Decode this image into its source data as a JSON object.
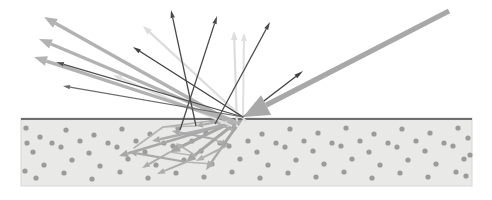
{
  "figure": {
    "width": 492,
    "height": 200,
    "background_color": "#ffffff"
  },
  "colors": {
    "background": "#ffffff",
    "substrate_fill": "#e9e9e7",
    "substrate_fill_right": "#ebebe9",
    "substrate_edge": "#d8d8d6",
    "surface_line": "#6f6f6f",
    "atom_dot": "#9b9b9b",
    "incident_beam": "#a8a8a8",
    "ejected_arrow_bold": "#b2b2b2",
    "ejected_arrow_thin_dark": "#555555",
    "ejected_arrow_faint": "#dcdcdc",
    "cascade_arrow": "#a6a6a6"
  },
  "substrate": {
    "label": "solid target material",
    "x": 21,
    "y": 118,
    "width": 451,
    "height": 68,
    "surface_line_y": 119,
    "surface_line_thickness": 2.2
  },
  "atoms": {
    "label": "target atoms",
    "radius": 2.6,
    "positions": [
      [
        40,
        137
      ],
      [
        66,
        130
      ],
      [
        94,
        135
      ],
      [
        122,
        129
      ],
      [
        150,
        134
      ],
      [
        178,
        128
      ],
      [
        206,
        133
      ],
      [
        234,
        128
      ],
      [
        262,
        134
      ],
      [
        290,
        129
      ],
      [
        318,
        133
      ],
      [
        346,
        128
      ],
      [
        374,
        134
      ],
      [
        402,
        129
      ],
      [
        430,
        133
      ],
      [
        458,
        128
      ],
      [
        33,
        152
      ],
      [
        61,
        147
      ],
      [
        89,
        153
      ],
      [
        117,
        147
      ],
      [
        145,
        152
      ],
      [
        173,
        146
      ],
      [
        201,
        151
      ],
      [
        229,
        146
      ],
      [
        257,
        152
      ],
      [
        285,
        147
      ],
      [
        313,
        151
      ],
      [
        341,
        146
      ],
      [
        369,
        152
      ],
      [
        397,
        147
      ],
      [
        425,
        151
      ],
      [
        453,
        146
      ],
      [
        470,
        155
      ],
      [
        44,
        165
      ],
      [
        72,
        160
      ],
      [
        100,
        166
      ],
      [
        128,
        159
      ],
      [
        156,
        165
      ],
      [
        184,
        160
      ],
      [
        212,
        164
      ],
      [
        240,
        159
      ],
      [
        268,
        165
      ],
      [
        296,
        160
      ],
      [
        324,
        164
      ],
      [
        352,
        159
      ],
      [
        380,
        165
      ],
      [
        408,
        160
      ],
      [
        436,
        164
      ],
      [
        464,
        159
      ],
      [
        36,
        178
      ],
      [
        64,
        173
      ],
      [
        92,
        179
      ],
      [
        120,
        172
      ],
      [
        148,
        178
      ],
      [
        176,
        173
      ],
      [
        204,
        177
      ],
      [
        232,
        172
      ],
      [
        260,
        178
      ],
      [
        288,
        173
      ],
      [
        316,
        177
      ],
      [
        344,
        172
      ],
      [
        372,
        178
      ],
      [
        400,
        173
      ],
      [
        428,
        177
      ],
      [
        456,
        172
      ],
      [
        26,
        128
      ],
      [
        27,
        143
      ],
      [
        25,
        171
      ],
      [
        468,
        138
      ],
      [
        466,
        176
      ],
      [
        108,
        143
      ],
      [
        136,
        141
      ],
      [
        164,
        143
      ],
      [
        192,
        141
      ],
      [
        220,
        143
      ],
      [
        248,
        141
      ],
      [
        276,
        143
      ],
      [
        304,
        141
      ],
      [
        332,
        143
      ],
      [
        360,
        141
      ],
      [
        388,
        143
      ],
      [
        416,
        141
      ],
      [
        444,
        143
      ],
      [
        52,
        143
      ],
      [
        80,
        141
      ]
    ]
  },
  "incident_beam": {
    "label": "incident ion beam",
    "start": [
      449,
      11
    ],
    "end": [
      243,
      117
    ],
    "line_width": 5.2,
    "arrowhead_length": 26,
    "arrowhead_half_width": 11,
    "color": "#a8a8a8"
  },
  "impact_point": {
    "label": "impact point",
    "x": 243,
    "y": 117
  },
  "sputtered_arrows": {
    "label": "sputtered / backscattered particles",
    "bold": [
      {
        "name": "sputter-bold-1",
        "from": [
          228,
          120
        ],
        "to": [
          44,
          17
        ],
        "width": 3.4,
        "head": 13,
        "color": "#b2b2b2"
      },
      {
        "name": "sputter-bold-2",
        "from": [
          236,
          122
        ],
        "to": [
          39,
          39
        ],
        "width": 3.4,
        "head": 13,
        "color": "#b2b2b2"
      },
      {
        "name": "sputter-bold-3",
        "from": [
          240,
          124
        ],
        "to": [
          34,
          57
        ],
        "width": 3.4,
        "head": 13,
        "color": "#b2b2b2"
      }
    ],
    "thin_dark": [
      {
        "name": "sputter-thin-1",
        "from": [
          243,
          117
        ],
        "to": [
          56,
          62
        ],
        "width": 1.3,
        "head": 8,
        "color": "#4f4f4f"
      },
      {
        "name": "sputter-thin-2",
        "from": [
          243,
          117
        ],
        "to": [
          133,
          47
        ],
        "width": 1.3,
        "head": 8,
        "color": "#3f3f3f"
      },
      {
        "name": "sputter-thin-3",
        "from": [
          196,
          126
        ],
        "to": [
          171,
          10
        ],
        "width": 1.3,
        "head": 8,
        "color": "#4a4a4a"
      },
      {
        "name": "sputter-thin-4",
        "from": [
          180,
          130
        ],
        "to": [
          217,
          16
        ],
        "width": 1.3,
        "head": 8,
        "color": "#4a4a4a"
      },
      {
        "name": "sputter-thin-5",
        "from": [
          215,
          124
        ],
        "to": [
          270,
          22
        ],
        "width": 1.3,
        "head": 8,
        "color": "#4a4a4a"
      },
      {
        "name": "sputter-thin-6",
        "from": [
          243,
          117
        ],
        "to": [
          303,
          71
        ],
        "width": 1.3,
        "head": 9,
        "color": "#3f3f3f"
      },
      {
        "name": "sputter-thin-7",
        "from": [
          243,
          117
        ],
        "to": [
          63,
          86
        ],
        "width": 1.2,
        "head": 7,
        "color": "#6a6a6a"
      }
    ],
    "faint": [
      {
        "name": "sputter-faint-1",
        "from": [
          246,
          121
        ],
        "to": [
          143,
          26
        ],
        "width": 2.2,
        "head": 9,
        "color": "#dcdcdc"
      },
      {
        "name": "sputter-faint-2",
        "from": [
          237,
          127
        ],
        "to": [
          234,
          31
        ],
        "width": 2.2,
        "head": 9,
        "color": "#dddddd"
      },
      {
        "name": "sputter-faint-3",
        "from": [
          243,
          117
        ],
        "to": [
          244,
          33
        ],
        "width": 2.0,
        "head": 8,
        "color": "#e0e0e0"
      },
      {
        "name": "sputter-faint-4",
        "from": [
          232,
          126
        ],
        "to": [
          113,
          75
        ],
        "width": 2.2,
        "head": 9,
        "color": "#dedede"
      }
    ]
  },
  "cascade_arrows": {
    "label": "subsurface collision cascade",
    "segments": [
      {
        "name": "cascade-1",
        "from": [
          243,
          117
        ],
        "to": [
          186,
          162
        ],
        "width": 3.0,
        "head": 10,
        "color": "#a6a6a6"
      },
      {
        "name": "cascade-2",
        "from": [
          243,
          117
        ],
        "to": [
          170,
          152
        ],
        "width": 3.0,
        "head": 10,
        "color": "#a6a6a6"
      },
      {
        "name": "cascade-3",
        "from": [
          243,
          117
        ],
        "to": [
          206,
          170
        ],
        "width": 2.6,
        "head": 9,
        "color": "#ababab"
      },
      {
        "name": "cascade-4",
        "from": [
          240,
          120
        ],
        "to": [
          119,
          156
        ],
        "width": 2.6,
        "head": 9,
        "color": "#a8a8a8"
      },
      {
        "name": "cascade-5",
        "from": [
          238,
          122
        ],
        "to": [
          152,
          141
        ],
        "width": 2.4,
        "head": 8,
        "color": "#adadad"
      },
      {
        "name": "cascade-6",
        "from": [
          186,
          162
        ],
        "to": [
          129,
          152
        ],
        "width": 2.2,
        "head": 8,
        "color": "#a9a9a9"
      },
      {
        "name": "cascade-7",
        "from": [
          186,
          162
        ],
        "to": [
          157,
          174
        ],
        "width": 2.0,
        "head": 8,
        "color": "#adadad"
      },
      {
        "name": "cascade-8",
        "from": [
          170,
          152
        ],
        "to": [
          142,
          168
        ],
        "width": 2.0,
        "head": 8,
        "color": "#adadad"
      },
      {
        "name": "cascade-9",
        "from": [
          214,
          139
        ],
        "to": [
          172,
          131
        ],
        "width": 2.2,
        "head": 8,
        "color": "#a9a9a9"
      },
      {
        "name": "cascade-10",
        "from": [
          226,
          146
        ],
        "to": [
          196,
          161
        ],
        "width": 2.0,
        "head": 8,
        "color": "#b0b0b0"
      },
      {
        "name": "cascade-11",
        "from": [
          243,
          117
        ],
        "to": [
          221,
          148
        ],
        "width": 2.4,
        "head": 8,
        "color": "#a6a6a6"
      },
      {
        "name": "cascade-12",
        "from": [
          232,
          130
        ],
        "to": [
          207,
          118
        ],
        "width": 2.0,
        "head": 7,
        "color": "#acacac"
      },
      {
        "name": "cascade-13",
        "from": [
          196,
          156
        ],
        "to": [
          176,
          143
        ],
        "width": 1.8,
        "head": 7,
        "color": "#b2b2b2"
      },
      {
        "name": "cascade-14",
        "from": [
          243,
          117
        ],
        "to": [
          196,
          126
        ],
        "width": 2.0,
        "head": 7,
        "color": "#aaaaaa"
      }
    ],
    "plain_lines": [
      {
        "name": "cascade-line-1",
        "from": [
          243,
          117
        ],
        "to": [
          163,
          127
        ],
        "width": 1.6,
        "color": "#b0b0b0"
      },
      {
        "name": "cascade-line-2",
        "from": [
          163,
          127
        ],
        "to": [
          134,
          148
        ],
        "width": 1.6,
        "color": "#b4b4b4"
      },
      {
        "name": "cascade-line-3",
        "from": [
          243,
          117
        ],
        "to": [
          214,
          139
        ],
        "width": 1.6,
        "color": "#b0b0b0"
      },
      {
        "name": "cascade-line-4",
        "from": [
          214,
          139
        ],
        "to": [
          226,
          146
        ],
        "width": 1.6,
        "color": "#b4b4b4"
      },
      {
        "name": "cascade-line-5",
        "from": [
          186,
          162
        ],
        "to": [
          212,
          164
        ],
        "width": 1.6,
        "color": "#b4b4b4"
      },
      {
        "name": "cascade-line-6",
        "from": [
          243,
          117
        ],
        "to": [
          232,
          130
        ],
        "width": 1.6,
        "color": "#b0b0b0"
      },
      {
        "name": "cascade-line-7",
        "from": [
          196,
          126
        ],
        "to": [
          163,
          127
        ],
        "width": 1.4,
        "color": "#b8b8b8"
      },
      {
        "name": "cascade-line-8",
        "from": [
          170,
          152
        ],
        "to": [
          196,
          156
        ],
        "width": 1.4,
        "color": "#b8b8b8"
      }
    ]
  }
}
